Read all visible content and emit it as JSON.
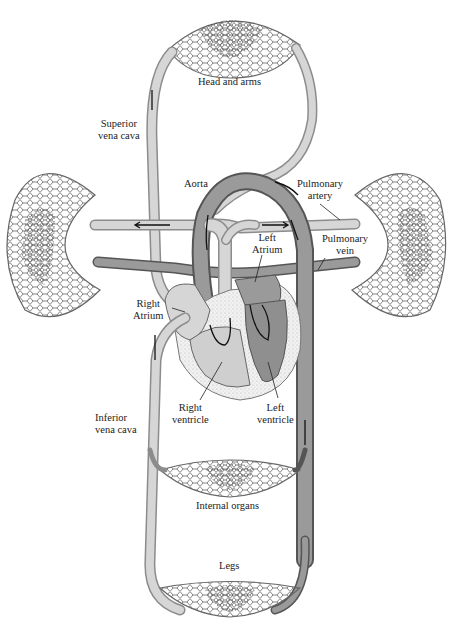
{
  "diagram": {
    "labels": {
      "head_and_arms": "Head and arms",
      "superior_vena_cava_1": "Superior",
      "superior_vena_cava_2": "vena cava",
      "aorta": "Aorta",
      "pulmonary_artery_1": "Pulmonary",
      "pulmonary_artery_2": "artery",
      "pulmonary_vein_1": "Pulmonary",
      "pulmonary_vein_2": "vein",
      "left_atrium_1": "Left",
      "left_atrium_2": "Atrium",
      "right_atrium_1": "Right",
      "right_atrium_2": "Atrium",
      "right_ventricle_1": "Right",
      "right_ventricle_2": "ventricle",
      "left_ventricle_1": "Left",
      "left_ventricle_2": "ventricle",
      "inferior_vena_cava_1": "Inferior",
      "inferior_vena_cava_2": "vena cava",
      "internal_organs": "Internal organs",
      "legs": "Legs"
    },
    "colors": {
      "deoxygenated_vessel": "#d6d6d6",
      "oxygenated_vessel": "#9a9a9a",
      "outline": "#555555",
      "background": "#ffffff"
    }
  }
}
